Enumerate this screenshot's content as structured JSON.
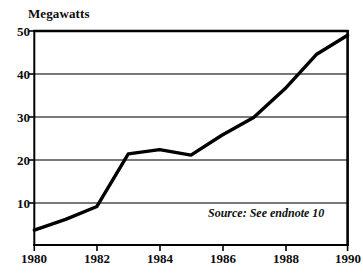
{
  "chart_data": {
    "type": "line",
    "title": "",
    "subtitle": "",
    "xlabel": "",
    "ylabel": "Megawatts",
    "x": [
      1980,
      1981,
      1982,
      1983,
      1984,
      1985,
      1986,
      1987,
      1988,
      1989,
      1990
    ],
    "values": [
      3.5,
      6.0,
      9.0,
      21.3,
      22.3,
      21.0,
      25.7,
      29.8,
      36.5,
      44.5,
      49.0
    ],
    "series": [
      {
        "name": "Megawatts",
        "values": [
          3.5,
          6.0,
          9.0,
          21.3,
          22.3,
          21.0,
          25.7,
          29.8,
          36.5,
          44.5,
          49.0
        ]
      }
    ],
    "xlim": [
      1980,
      1990
    ],
    "ylim": [
      0,
      50
    ],
    "ytick_labels": [
      "50",
      "40",
      "30",
      "20",
      "10"
    ],
    "ytick_values": [
      50,
      40,
      30,
      20,
      10
    ],
    "xtick_labels": [
      "1980",
      "1982",
      "1984",
      "1986",
      "1988",
      "1990"
    ],
    "xtick_values": [
      1980,
      1982,
      1984,
      1986,
      1988,
      1990
    ],
    "grid": "horizontal",
    "legend": "none",
    "annotations": [
      "Source: See endnote 10"
    ],
    "line_color": "#000000",
    "grid_color": "#4d4d4d",
    "frame_color": "#000000",
    "background_color": "#ffffff"
  },
  "annotation": {
    "source_note": "Source: See endnote 10"
  }
}
